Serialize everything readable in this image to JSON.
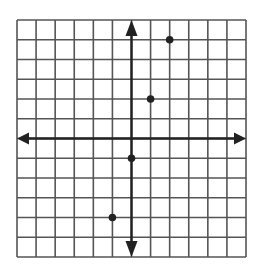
{
  "chart_data": {
    "type": "scatter",
    "title": "",
    "xlabel": "",
    "ylabel": "",
    "xlim": [
      -6,
      6
    ],
    "ylim": [
      -6,
      6
    ],
    "grid": true,
    "grid_step": 1,
    "axes_arrows": true,
    "tick_labels": false,
    "series": [
      {
        "name": "points",
        "x": [
          2,
          1,
          0,
          -1
        ],
        "y": [
          5,
          2,
          -1,
          -4
        ]
      }
    ]
  },
  "style": {
    "grid_color": "#555555",
    "axis_color": "#222222",
    "point_color": "#222222",
    "background": "#ffffff"
  },
  "layout": {
    "left": 17,
    "top": 20,
    "right": 246,
    "bottom": 257
  }
}
